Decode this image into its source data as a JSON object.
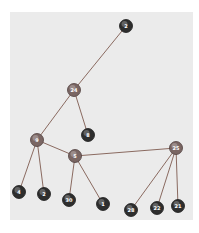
{
  "diagram": {
    "type": "tree-graph",
    "nodes": [
      {
        "id": "n2top",
        "label": "2",
        "x": 126,
        "y": 26,
        "style": "dark"
      },
      {
        "id": "n24",
        "label": "24",
        "x": 74,
        "y": 90,
        "style": "light"
      },
      {
        "id": "n8",
        "label": "8",
        "x": 88,
        "y": 135,
        "style": "dark"
      },
      {
        "id": "n9",
        "label": "9",
        "x": 37,
        "y": 140,
        "style": "light"
      },
      {
        "id": "n5",
        "label": "5",
        "x": 75,
        "y": 156,
        "style": "light"
      },
      {
        "id": "n25",
        "label": "25",
        "x": 176,
        "y": 148,
        "style": "light"
      },
      {
        "id": "n4",
        "label": "4",
        "x": 19,
        "y": 192,
        "style": "dark"
      },
      {
        "id": "n2",
        "label": "2",
        "x": 44,
        "y": 194,
        "style": "dark"
      },
      {
        "id": "n30",
        "label": "30",
        "x": 69,
        "y": 200,
        "style": "dark"
      },
      {
        "id": "n1",
        "label": "1",
        "x": 103,
        "y": 204,
        "style": "dark"
      },
      {
        "id": "n28",
        "label": "28",
        "x": 131,
        "y": 210,
        "style": "dark"
      },
      {
        "id": "n22",
        "label": "22",
        "x": 157,
        "y": 208,
        "style": "dark"
      },
      {
        "id": "n21",
        "label": "21",
        "x": 178,
        "y": 206,
        "style": "dark"
      }
    ],
    "edges": [
      [
        "n2top",
        "n24"
      ],
      [
        "n24",
        "n9"
      ],
      [
        "n24",
        "n8"
      ],
      [
        "n9",
        "n4"
      ],
      [
        "n9",
        "n2"
      ],
      [
        "n9",
        "n5"
      ],
      [
        "n5",
        "n30"
      ],
      [
        "n5",
        "n1"
      ],
      [
        "n5",
        "n25"
      ],
      [
        "n25",
        "n28"
      ],
      [
        "n25",
        "n22"
      ],
      [
        "n25",
        "n21"
      ]
    ],
    "colors": {
      "panel": "#ebebeb",
      "edge": "#8a6a60",
      "node_dark": "#2e2e2e",
      "node_light": "#7a6663",
      "label": "#ffffff"
    }
  }
}
